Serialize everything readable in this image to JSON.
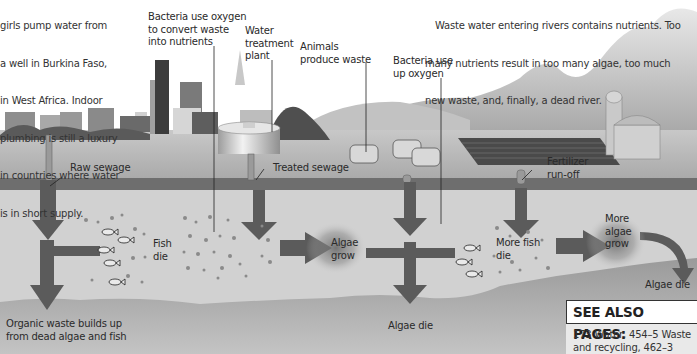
{
  "intro_caption": {
    "lines": [
      "girls pump water from",
      "a well in Burkina Faso,",
      "in West Africa. Indoor",
      "plumbing is still a luxury",
      "in countries where water",
      "is in short supply."
    ]
  },
  "summary_caption": {
    "lines": [
      "Waste water entering rivers contains nutrients. Too",
      "many nutrients result in too many algae, too much",
      "new waste, and, finally, a dead river."
    ]
  },
  "labels": {
    "bacteria_convert": "Bacteria use oxygen\nto convert waste\ninto nutrients",
    "water_treatment": "Water\ntreatment\nplant",
    "animals_waste": "Animals\nproduce waste",
    "bacteria_use_up": "Bacteria use\nup oxygen",
    "raw_sewage": "Raw sewage",
    "treated_sewage": "Treated sewage",
    "fertilizer_runoff": "Fertilizer\nrun-off",
    "fish_die": "Fish\ndie",
    "algae_grow": "Algae\ngrow",
    "more_fish_die": "More fish\ndie",
    "more_algae_grow": "More\nalgae\ngrow",
    "algae_die_center": "Algae die",
    "algae_die_right": "Algae die",
    "organic_waste": "Organic waste builds up\nfrom dead algae and fish"
  },
  "see_also": {
    "title": "SEE ALSO PAGES:",
    "body": "173 Water, 454–5 Waste\nand recycling, 462–3"
  },
  "colors": {
    "river_water": "#cfcfcf",
    "riverbed": "#8a8a8a",
    "ground": "#b8b8b8",
    "pipe_band": "#6e6e6e",
    "arrow": "#5a5a5a",
    "mountains": "#bdbdbd",
    "text": "#2a2a2a"
  }
}
